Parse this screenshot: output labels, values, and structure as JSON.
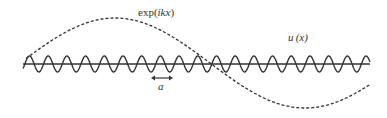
{
  "diagram": {
    "labels": {
      "plane_wave": "exp(ikx)",
      "plane_wave_prefix": "exp(",
      "plane_wave_arg": "ikx",
      "plane_wave_suffix": ")",
      "periodic_function": "u (x)",
      "periodic_function_name": "u",
      "periodic_function_arg": "(x)",
      "lattice_constant": "a"
    },
    "curves": [
      {
        "name": "periodic-function-u",
        "style": "solid",
        "period_px": 18.7,
        "amplitude_px": 8
      },
      {
        "name": "plane-wave-envelope",
        "style": "dashed",
        "shape": "cosine",
        "x_start": 26,
        "x_end": 370
      }
    ],
    "axis": {
      "x_start": 23,
      "x_end": 370,
      "y": 64
    },
    "colors": {
      "line": "#333333",
      "background": "#ffffff"
    }
  }
}
